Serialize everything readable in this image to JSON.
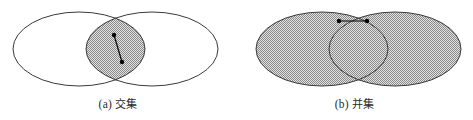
{
  "figure": {
    "title": "",
    "width": 473,
    "height": 120,
    "background_color": "#ffffff",
    "stroke_color": "#333333",
    "fill_pattern_color": "#8f8f8f",
    "fill_pattern_background": "#dcdcdc",
    "marker_color": "#000000"
  },
  "panels": [
    {
      "id": "panel-a",
      "caption_index": "(a)",
      "caption_text": "交集",
      "caption_full": "(a) 交集",
      "meaning": "intersection",
      "shaded_region": "lens-overlap",
      "ellipses": [
        {
          "cx": 79,
          "cy": 49,
          "rx": 66,
          "ry": 37,
          "fill": "none"
        },
        {
          "cx": 152,
          "cy": 49,
          "rx": 66,
          "ry": 37,
          "fill": "none"
        }
      ],
      "segment": {
        "x1": 114,
        "y1": 35,
        "x2": 122,
        "y2": 62,
        "endpoint_markers": 2,
        "marker_radius": 2.2
      }
    },
    {
      "id": "panel-b",
      "caption_index": "(b)",
      "caption_text": "并集",
      "caption_full": "(b) 并集",
      "meaning": "union",
      "shaded_region": "both-ellipses",
      "ellipses": [
        {
          "cx": 322,
          "cy": 49,
          "rx": 66,
          "ry": 37,
          "fill": "pattern"
        },
        {
          "cx": 395,
          "cy": 49,
          "rx": 66,
          "ry": 37,
          "fill": "pattern"
        }
      ],
      "segment": {
        "x1": 339,
        "y1": 21,
        "x2": 367,
        "y2": 21,
        "endpoint_markers": 2,
        "marker_radius": 2.2
      }
    }
  ]
}
